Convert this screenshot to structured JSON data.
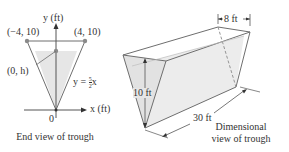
{
  "end_view": {
    "y_axis_label": "y (ft)",
    "x_axis_label": "x (ft)",
    "origin_label": "0",
    "left_top_point": "(−4, 10)",
    "right_top_point": "(4, 10)",
    "water_point": "(0, h)",
    "line_eq_prefix": "y = ",
    "line_eq_num": "5",
    "line_eq_den": "2",
    "line_eq_suffix": "x",
    "caption": "End view of trough"
  },
  "dimensional_view": {
    "width_label": "8 ft",
    "height_label": "10 ft",
    "length_label": "30 ft",
    "caption_line1": "Dimensional",
    "caption_line2": "view of trough"
  },
  "colors": {
    "line": "#6e6e6e",
    "water": "#e8e8e8",
    "point": "#8a8a8a",
    "text": "#333333"
  }
}
